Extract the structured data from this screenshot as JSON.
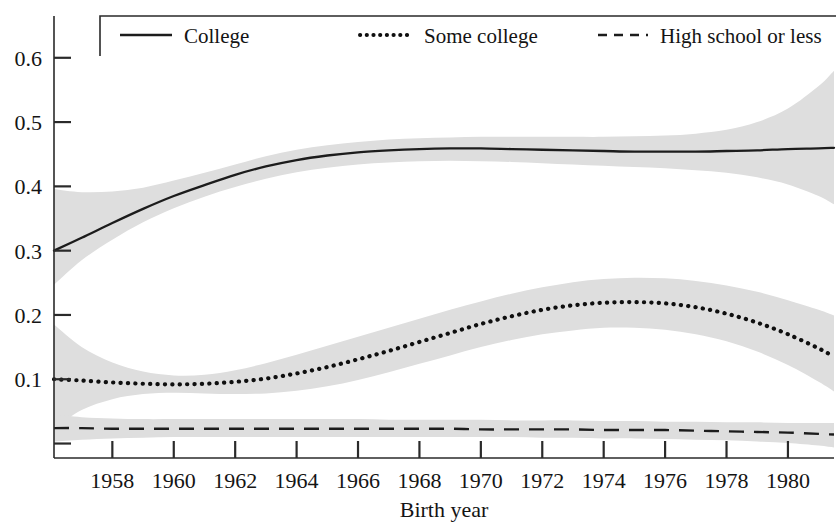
{
  "chart_data": {
    "type": "line",
    "title": "",
    "xlabel": "Birth year",
    "ylabel": "",
    "xlim": [
      1956.1,
      1981.5
    ],
    "ylim": [
      -0.0225,
      0.665
    ],
    "grid": false,
    "legend_position": "top-inside",
    "x_tick_labels": [
      "1958",
      "1960",
      "1962",
      "1964",
      "1966",
      "1968",
      "1970",
      "1972",
      "1974",
      "1976",
      "1978",
      "1980"
    ],
    "x_ticks": [
      1958,
      1960,
      1962,
      1964,
      1966,
      1968,
      1970,
      1972,
      1974,
      1976,
      1978,
      1980
    ],
    "y_tick_labels": [
      "0.1",
      "0.2",
      "0.3",
      "0.4",
      "0.5",
      "0.6"
    ],
    "y_ticks": [
      0.0,
      0.1,
      0.2,
      0.3,
      0.4,
      0.5,
      0.6
    ],
    "band_color": "#dedede",
    "line_color": "#1c1c1c",
    "x": [
      1956.1,
      1957,
      1958,
      1959,
      1960,
      1961,
      1962,
      1963,
      1964,
      1965,
      1966,
      1967,
      1968,
      1969,
      1970,
      1971,
      1972,
      1973,
      1974,
      1975,
      1976,
      1977,
      1978,
      1979,
      1980,
      1981,
      1981.5
    ],
    "series": [
      {
        "name": "College",
        "style": "solid",
        "values": [
          0.3,
          0.32,
          0.343,
          0.365,
          0.385,
          0.402,
          0.418,
          0.431,
          0.441,
          0.448,
          0.453,
          0.456,
          0.458,
          0.459,
          0.459,
          0.458,
          0.457,
          0.456,
          0.455,
          0.454,
          0.454,
          0.454,
          0.455,
          0.456,
          0.458,
          0.459,
          0.46
        ],
        "band_lower": [
          0.247,
          0.285,
          0.317,
          0.344,
          0.366,
          0.384,
          0.399,
          0.412,
          0.422,
          0.429,
          0.434,
          0.437,
          0.439,
          0.44,
          0.439,
          0.438,
          0.436,
          0.434,
          0.432,
          0.43,
          0.428,
          0.425,
          0.421,
          0.414,
          0.403,
          0.385,
          0.372
        ],
        "band_upper": [
          0.396,
          0.391,
          0.392,
          0.398,
          0.409,
          0.421,
          0.434,
          0.447,
          0.457,
          0.464,
          0.469,
          0.473,
          0.475,
          0.476,
          0.477,
          0.477,
          0.477,
          0.477,
          0.477,
          0.478,
          0.479,
          0.482,
          0.488,
          0.5,
          0.521,
          0.556,
          0.58
        ]
      },
      {
        "name": "Some college",
        "style": "dotted",
        "values": [
          0.1,
          0.098,
          0.095,
          0.093,
          0.092,
          0.093,
          0.096,
          0.101,
          0.109,
          0.119,
          0.131,
          0.144,
          0.158,
          0.172,
          0.186,
          0.198,
          0.208,
          0.215,
          0.219,
          0.22,
          0.218,
          0.212,
          0.202,
          0.188,
          0.17,
          0.148,
          0.135
        ]
      }
    ],
    "bands": [
      {
        "name": "Some college band",
        "lower": [
          0.023,
          0.052,
          0.069,
          0.077,
          0.079,
          0.078,
          0.077,
          0.078,
          0.082,
          0.089,
          0.099,
          0.111,
          0.124,
          0.137,
          0.15,
          0.161,
          0.17,
          0.176,
          0.18,
          0.18,
          0.177,
          0.17,
          0.159,
          0.143,
          0.122,
          0.096,
          0.081
        ],
        "upper": [
          0.185,
          0.15,
          0.126,
          0.112,
          0.106,
          0.107,
          0.114,
          0.125,
          0.138,
          0.152,
          0.166,
          0.18,
          0.194,
          0.208,
          0.221,
          0.233,
          0.243,
          0.251,
          0.256,
          0.258,
          0.257,
          0.253,
          0.246,
          0.236,
          0.223,
          0.208,
          0.199
        ]
      },
      {
        "name": "High school or less band",
        "lower": [
          0.003,
          0.006,
          0.008,
          0.009,
          0.01,
          0.01,
          0.01,
          0.01,
          0.01,
          0.01,
          0.01,
          0.01,
          0.01,
          0.01,
          0.01,
          0.01,
          0.009,
          0.009,
          0.008,
          0.008,
          0.007,
          0.006,
          0.005,
          0.003,
          0.001,
          -0.003,
          -0.006
        ],
        "upper": [
          0.045,
          0.041,
          0.039,
          0.038,
          0.038,
          0.038,
          0.038,
          0.038,
          0.038,
          0.038,
          0.038,
          0.037,
          0.037,
          0.037,
          0.037,
          0.036,
          0.036,
          0.036,
          0.035,
          0.035,
          0.034,
          0.034,
          0.033,
          0.033,
          0.032,
          0.032,
          0.032
        ]
      }
    ],
    "series3": {
      "name": "High school or less",
      "style": "dashed",
      "values": [
        0.024,
        0.024,
        0.023,
        0.023,
        0.023,
        0.023,
        0.023,
        0.023,
        0.023,
        0.023,
        0.023,
        0.023,
        0.023,
        0.023,
        0.022,
        0.022,
        0.022,
        0.022,
        0.021,
        0.021,
        0.021,
        0.02,
        0.019,
        0.018,
        0.017,
        0.015,
        0.014
      ]
    }
  },
  "legend": {
    "items": [
      {
        "label": "College",
        "style": "solid"
      },
      {
        "label": "Some college",
        "style": "dotted"
      },
      {
        "label": "High school or less",
        "style": "dashed"
      }
    ]
  },
  "axes": {
    "x_title": "Birth year"
  }
}
